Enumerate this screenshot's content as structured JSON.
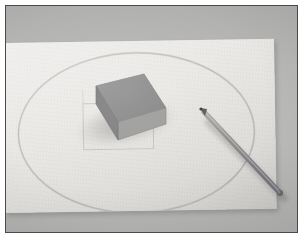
{
  "image": {
    "title": "Grey block and pencil on a sheet of paper",
    "description": "A photograph of a rectangular grey block resting on a large sheet of off-white drawing paper laid on a grey table. A faint pencil ellipse and a faint pencil rectangle are drawn on the paper, and a grey pencil lies diagonally to the right of the block.",
    "scene_type": "still-life-photograph",
    "width": 304,
    "height": 249
  },
  "colors": {
    "page_background": "#ffffff",
    "frame_border": "#4a4a4a",
    "table_surface": "#b6b6b4",
    "table_surface_dark": "#b0b0ae",
    "paper": "#e9e8e5",
    "paper_shadow": "#dedddA",
    "block_top_face": "#8a8a8a",
    "block_front_face": "#9a9a98",
    "block_side_face": "#7e7e7e",
    "pencil_body": "#8e8e8c",
    "pencil_tip": "#55555a",
    "pencil_lead": "#3a3a3c",
    "drawing_graphite": "#b3b0ad"
  },
  "objects": [
    {
      "name": "table-surface",
      "label": "Grey table surface",
      "bounds": {
        "x": 5,
        "y": 5,
        "width": 293,
        "height": 228
      }
    },
    {
      "name": "paper-sheet",
      "label": "Sheet of off-white drawing paper",
      "bounds": {
        "x": 0,
        "y": 40,
        "width": 272,
        "height": 168
      },
      "rotation_deg": -0.9
    },
    {
      "name": "drawn-ellipse",
      "label": "Faint pencil ellipse drawn on the paper",
      "center": {
        "x": 128,
        "y": 128
      },
      "radius_x": 118,
      "radius_y": 80
    },
    {
      "name": "drawn-rectangle",
      "label": "Faint pencil rectangle drawn on the paper",
      "bounds": {
        "x": 78,
        "y": 104,
        "width": 68,
        "height": 40
      }
    },
    {
      "name": "grey-block",
      "label": "Rectangular grey block",
      "bounds": {
        "x": 66,
        "y": 68,
        "width": 94,
        "height": 72
      }
    },
    {
      "name": "pencil",
      "label": "Grey pencil lying diagonally",
      "tip": {
        "x": 195,
        "y": 104
      },
      "end": {
        "x": 276,
        "y": 188
      },
      "angle_deg": 46
    }
  ],
  "annotations": {
    "light_direction": "upper-left",
    "shadow_direction": "lower-right"
  }
}
